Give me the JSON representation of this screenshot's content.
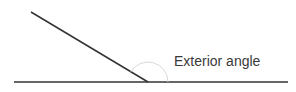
{
  "diagram": {
    "label": "Exterior angle",
    "colors": {
      "line": "#333333",
      "arc": "#d8d8d8",
      "text": "#3a3a3a",
      "background": "#ffffff"
    },
    "baseline": {
      "x1": 14,
      "y1": 82,
      "x2": 288,
      "y2": 82
    },
    "slanted_line": {
      "x1": 31,
      "y1": 12,
      "x2": 148,
      "y2": 82
    },
    "vertex": {
      "x": 148,
      "y": 82
    },
    "arc_radius": 20
  }
}
